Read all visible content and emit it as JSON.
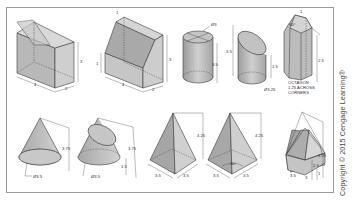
{
  "figure": {
    "copyright": "Copyright © 2015 Cengage Learning®",
    "colors": {
      "face_light": "#d6d6d6",
      "face_mid": "#bdbdbd",
      "face_dark": "#9e9e9e",
      "outline": "#3a3a3a",
      "frame": "#9a9a9a"
    },
    "shapes": [
      {
        "name": "rectangular-prism-with-cut-top",
        "dimensions": {
          "width": "4",
          "depth": "2",
          "height": "3"
        }
      },
      {
        "name": "prism-with-inclined-face",
        "dimensions": {
          "width": "4",
          "depth": "2",
          "height": "3",
          "left_height": "1",
          "top": "1"
        }
      },
      {
        "name": "cylinder",
        "dimensions": {
          "diameter": "Ø3",
          "height": "3.5"
        }
      },
      {
        "name": "truncated-cylinder",
        "dimensions": {
          "height": "3.5",
          "short_height": "1.5",
          "diameter": "Ø3.25"
        }
      },
      {
        "name": "truncated-octagonal-prism",
        "dimensions": {
          "height": "2.5",
          "angle": "60°",
          "top": "1"
        },
        "note": [
          "OCTAGON",
          "1.25 ACROSS",
          "CORNERS"
        ]
      },
      {
        "name": "cone",
        "dimensions": {
          "height": "3.75",
          "diameter": "Ø3.5"
        }
      },
      {
        "name": "truncated-cone",
        "dimensions": {
          "height": "3.75",
          "cut_height": "1.5",
          "diameter": "Ø3.5"
        }
      },
      {
        "name": "square-pyramid",
        "dimensions": {
          "height": "4.25",
          "base_a": "3.5",
          "base_b": "3.5"
        }
      },
      {
        "name": "rotated-pyramid",
        "dimensions": {
          "height": "4.25",
          "base_a": "3.5",
          "base_b": "3.5",
          "angle": "90°"
        }
      },
      {
        "name": "truncated-pyramid",
        "dimensions": {
          "height": "4.25",
          "lower_height": "2.5",
          "small": "1",
          "base_a": "3.5",
          "base_b": "3"
        }
      }
    ]
  }
}
